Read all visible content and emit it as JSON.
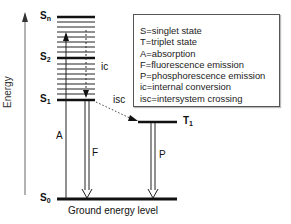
{
  "diagram": {
    "type": "jablonski",
    "axis": {
      "label": "Energy"
    },
    "states": [
      {
        "name": "S",
        "sub": "n",
        "kind": "singlet"
      },
      {
        "name": "S",
        "sub": "2",
        "kind": "singlet"
      },
      {
        "name": "S",
        "sub": "1",
        "kind": "singlet"
      },
      {
        "name": "S",
        "sub": "0",
        "kind": "singlet"
      },
      {
        "name": "T",
        "sub": "1",
        "kind": "triplet"
      }
    ],
    "transitions": {
      "absorption": "A",
      "fluorescence": "F",
      "phosphorescence": "P",
      "internal_conversion": "ic",
      "intersystem_crossing": "isc"
    },
    "ground_label": "Ground energy level",
    "legend": [
      "S=singlet state",
      "T=triplet state",
      "A=absorption",
      "F=fluorescence emission",
      "P=phosphorescence emission",
      "ic=internal conversion",
      "isc=intersystem crossing"
    ]
  }
}
